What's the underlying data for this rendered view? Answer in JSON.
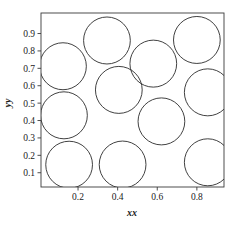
{
  "figure": {
    "title": "",
    "background_color": "#ffffff",
    "frame_color": "#3a3a3a",
    "circle_color": "#2b2b2b"
  },
  "axes": {
    "x_label": "xx",
    "y_label": "yy",
    "x_ticks": [
      "0.2",
      "0.4",
      "0.6",
      "0.8"
    ],
    "y_ticks": [
      "0.1",
      "0.2",
      "0.3",
      "0.4",
      "0.5",
      "0.6",
      "0.7",
      "0.8",
      "0.9"
    ]
  },
  "chart_data": {
    "type": "scatter",
    "title": "",
    "xlabel": "xx",
    "ylabel": "yy",
    "xlim": [
      0.013,
      0.937
    ],
    "ylim": [
      0.018,
      1.018
    ],
    "grid": false,
    "legend": null,
    "x_tick_values": [
      0.2,
      0.4,
      0.6,
      0.8
    ],
    "y_tick_values": [
      0.1,
      0.2,
      0.3,
      0.4,
      0.5,
      0.6,
      0.7,
      0.8,
      0.9
    ],
    "marker": "open-circle",
    "radius_x_data": 0.118,
    "radius_y_data": 0.135,
    "series": [
      {
        "name": "packed circles",
        "points": [
          {
            "x": 0.124,
            "y": 0.712
          },
          {
            "x": 0.346,
            "y": 0.86
          },
          {
            "x": 0.58,
            "y": 0.727
          },
          {
            "x": 0.8,
            "y": 0.863
          },
          {
            "x": 0.855,
            "y": 0.562
          },
          {
            "x": 0.406,
            "y": 0.576
          },
          {
            "x": 0.129,
            "y": 0.43
          },
          {
            "x": 0.621,
            "y": 0.395
          },
          {
            "x": 0.155,
            "y": 0.146
          },
          {
            "x": 0.425,
            "y": 0.147
          },
          {
            "x": 0.855,
            "y": 0.16
          }
        ]
      }
    ]
  }
}
